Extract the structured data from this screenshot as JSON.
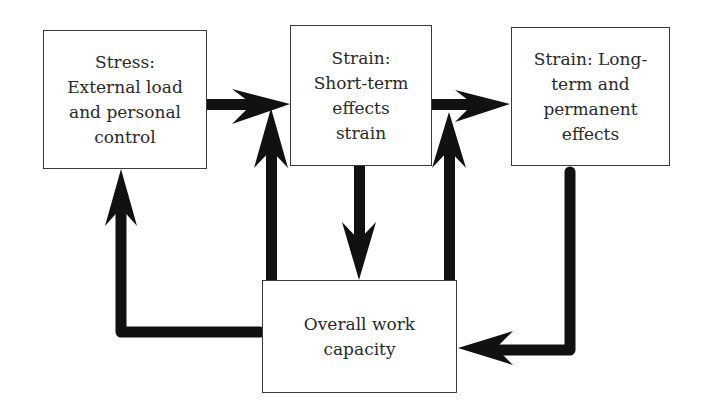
{
  "diagram": {
    "type": "flow",
    "nodes": [
      {
        "id": "stress",
        "label": "Stress:\nExternal load\nand personal\ncontrol"
      },
      {
        "id": "short_term",
        "label": "Strain:\nShort-term\neffects\nstrain"
      },
      {
        "id": "long_term",
        "label": "Strain: Long-\nterm and\npermanent\neffects"
      },
      {
        "id": "capacity",
        "label": "Overall work\ncapacity"
      }
    ],
    "edges": [
      {
        "from": "stress",
        "to": "short_term"
      },
      {
        "from": "short_term",
        "to": "long_term"
      },
      {
        "from": "short_term",
        "to": "capacity"
      },
      {
        "from": "capacity",
        "to": "short_term"
      },
      {
        "from": "capacity",
        "to": "long_term"
      },
      {
        "from": "long_term",
        "to": "capacity"
      },
      {
        "from": "capacity",
        "to": "stress"
      }
    ],
    "colors": {
      "arrow": "#111111",
      "border": "#3a3a3a",
      "text": "#2a2a2a",
      "background": "#ffffff"
    }
  }
}
